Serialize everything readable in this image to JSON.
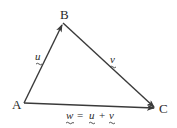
{
  "diagram": {
    "type": "vector-triangle",
    "colors": {
      "line": "#3a3a3a",
      "text": "#2a2a2a",
      "background": "#ffffff"
    },
    "vertices": [
      {
        "id": "A",
        "label": "A"
      },
      {
        "id": "B",
        "label": "B"
      },
      {
        "id": "C",
        "label": "C"
      }
    ],
    "edges": [
      {
        "from": "A",
        "to": "B",
        "label": "u"
      },
      {
        "from": "B",
        "to": "C",
        "label": "v"
      },
      {
        "from": "A",
        "to": "C",
        "label": "w = u + v"
      }
    ],
    "equation": {
      "lhs": "w",
      "eq": "=",
      "a": "u",
      "plus": "+",
      "b": "v"
    }
  }
}
